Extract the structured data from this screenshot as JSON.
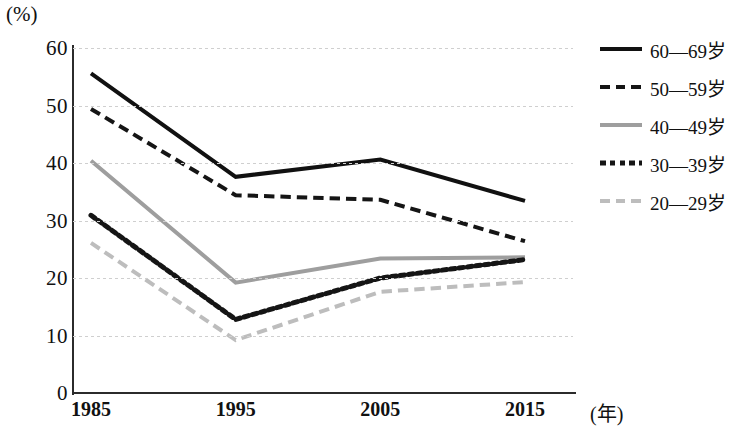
{
  "chart_data": {
    "type": "line",
    "title": "",
    "xlabel": "(年)",
    "ylabel": "(%)",
    "x": [
      "1985",
      "1995",
      "2005",
      "2015"
    ],
    "categories": [
      "1985",
      "1995",
      "2005",
      "2015"
    ],
    "ylim": [
      0,
      60
    ],
    "y_ticks": [
      "0",
      "10",
      "20",
      "30",
      "40",
      "50",
      "60"
    ],
    "grid": true,
    "legend_position": "right",
    "series": [
      {
        "name": "60—69岁",
        "values": [
          55.6,
          37.6,
          40.6,
          33.4
        ],
        "style": "solid",
        "color": "#111111",
        "width": 4
      },
      {
        "name": "50—59岁",
        "values": [
          49.4,
          34.4,
          33.6,
          26.4
        ],
        "style": "dashed",
        "color": "#151515",
        "width": 4
      },
      {
        "name": "40—49岁",
        "values": [
          40.4,
          19.2,
          23.4,
          23.6
        ],
        "style": "solid",
        "color": "#9e9e9e",
        "width": 4
      },
      {
        "name": "30—39岁",
        "values": [
          30.9,
          12.8,
          20.0,
          23.2
        ],
        "style": "dotted",
        "color": "#151515",
        "width": 5
      },
      {
        "name": "20—29岁",
        "values": [
          26.1,
          9.2,
          17.6,
          19.3
        ],
        "style": "dashed",
        "color": "#bdbdbd",
        "width": 4
      }
    ]
  },
  "axes": {
    "y_unit": "(%)",
    "x_unit": "(年)"
  },
  "legend": {
    "items": [
      {
        "label": "60—69岁"
      },
      {
        "label": "50—59岁"
      },
      {
        "label": "40—49岁"
      },
      {
        "label": "30—39岁"
      },
      {
        "label": "20—29岁"
      }
    ]
  }
}
